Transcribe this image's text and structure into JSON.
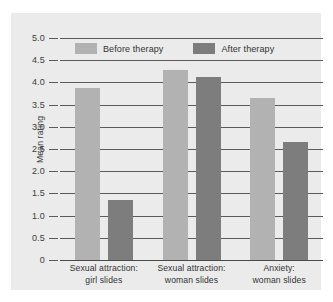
{
  "chart_data": {
    "type": "bar",
    "title": "",
    "subtitle": "",
    "xlabel": "",
    "ylabel": "Mean rating",
    "ylim": [
      0,
      5.0
    ],
    "yticks": [
      "0",
      "0.5",
      "1.0",
      "1.5",
      "2.0",
      "2.5",
      "3.0",
      "3.5",
      "4.0",
      "4.5",
      "5.0"
    ],
    "ytick_values": [
      0,
      0.5,
      1.0,
      1.5,
      2.0,
      2.5,
      3.0,
      3.5,
      4.0,
      4.5,
      5.0
    ],
    "grid": true,
    "legend_position": "top-center-inside",
    "categories": [
      "Sexual attraction:\ngirl slides",
      "Sexual attraction:\nwoman slides",
      "Anxiety:\nwoman slides"
    ],
    "category_lines": [
      [
        "Sexual attraction:",
        "girl slides"
      ],
      [
        "Sexual attraction:",
        "woman slides"
      ],
      [
        "Anxiety:",
        "woman slides"
      ]
    ],
    "series": [
      {
        "name": "Before therapy",
        "color": "#b2b2b2",
        "values": [
          3.88,
          4.28,
          3.65
        ]
      },
      {
        "name": "After therapy",
        "color": "#7d7d7d",
        "values": [
          1.35,
          4.12,
          2.65
        ]
      }
    ]
  },
  "style": {
    "page_background": "#ffffff",
    "panel_background": "#ebebeb",
    "gridline_color": "#5a5a5a",
    "axis_color": "#4a4a4a",
    "text_color": "#333333"
  }
}
